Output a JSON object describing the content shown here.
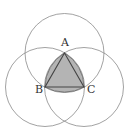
{
  "figure": {
    "radius": 39.5,
    "points": {
      "A": {
        "label": "A",
        "x": 64.5,
        "y": 53
      },
      "B": {
        "label": "B",
        "x": 45,
        "y": 87
      },
      "C": {
        "label": "C",
        "x": 84,
        "y": 87
      }
    },
    "colors": {
      "background": "#ffffff",
      "circle_stroke": "#8a8a8a",
      "shaded_fill": "#b4b4b4",
      "triangle_stroke": "#444444",
      "label": "#333333"
    }
  }
}
